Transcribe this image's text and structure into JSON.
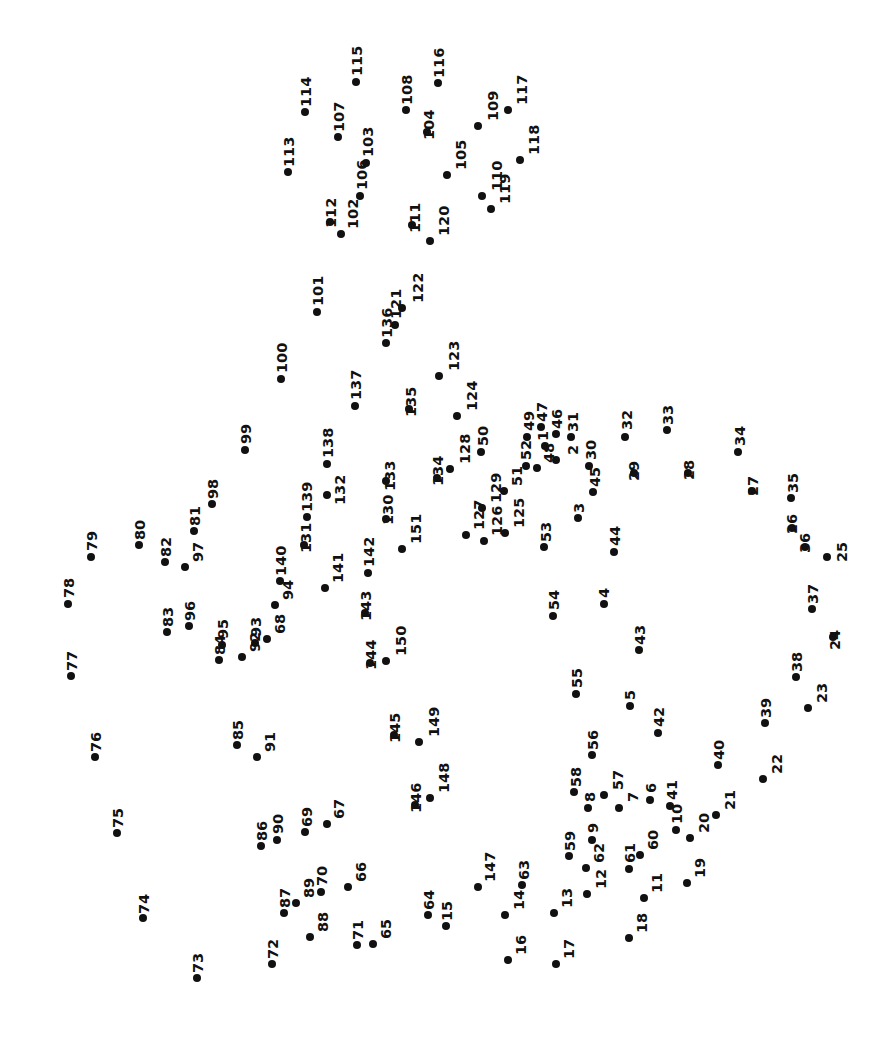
{
  "page": {
    "width": 894,
    "height": 1052,
    "background_color": "#ffffff",
    "dot_color": "#111111",
    "label_color": "#111111",
    "label_rotation_degrees": -90,
    "dot_count": 151
  },
  "dots": [
    {
      "n": "1",
      "x": 545,
      "y": 446,
      "lx": 536,
      "ly": 441
    },
    {
      "n": "2",
      "x": 556,
      "y": 460,
      "lx": 566,
      "ly": 455
    },
    {
      "n": "3",
      "x": 578,
      "y": 518,
      "lx": 572,
      "ly": 513
    },
    {
      "n": "4",
      "x": 604,
      "y": 604,
      "lx": 597,
      "ly": 598
    },
    {
      "n": "5",
      "x": 630,
      "y": 706,
      "lx": 623,
      "ly": 700
    },
    {
      "n": "6",
      "x": 650,
      "y": 800,
      "lx": 644,
      "ly": 793
    },
    {
      "n": "7",
      "x": 619,
      "y": 808,
      "lx": 626,
      "ly": 802
    },
    {
      "n": "8",
      "x": 588,
      "y": 808,
      "lx": 583,
      "ly": 802
    },
    {
      "n": "9",
      "x": 592,
      "y": 840,
      "lx": 586,
      "ly": 833
    },
    {
      "n": "10",
      "x": 676,
      "y": 830,
      "lx": 670,
      "ly": 824
    },
    {
      "n": "11",
      "x": 644,
      "y": 898,
      "lx": 650,
      "ly": 893
    },
    {
      "n": "12",
      "x": 587,
      "y": 894,
      "lx": 594,
      "ly": 889
    },
    {
      "n": "13",
      "x": 554,
      "y": 913,
      "lx": 560,
      "ly": 908
    },
    {
      "n": "14",
      "x": 505,
      "y": 915,
      "lx": 512,
      "ly": 910
    },
    {
      "n": "15",
      "x": 446,
      "y": 926,
      "lx": 440,
      "ly": 921
    },
    {
      "n": "16",
      "x": 508,
      "y": 960,
      "lx": 514,
      "ly": 955
    },
    {
      "n": "17",
      "x": 556,
      "y": 964,
      "lx": 562,
      "ly": 959
    },
    {
      "n": "18",
      "x": 629,
      "y": 938,
      "lx": 635,
      "ly": 933
    },
    {
      "n": "19",
      "x": 687,
      "y": 883,
      "lx": 693,
      "ly": 878
    },
    {
      "n": "20",
      "x": 690,
      "y": 838,
      "lx": 697,
      "ly": 833
    },
    {
      "n": "21",
      "x": 716,
      "y": 815,
      "lx": 723,
      "ly": 810
    },
    {
      "n": "22",
      "x": 763,
      "y": 779,
      "lx": 770,
      "ly": 774
    },
    {
      "n": "23",
      "x": 808,
      "y": 708,
      "lx": 815,
      "ly": 703
    },
    {
      "n": "24",
      "x": 833,
      "y": 637,
      "lx": 828,
      "ly": 650
    },
    {
      "n": "25",
      "x": 827,
      "y": 557,
      "lx": 835,
      "ly": 562
    },
    {
      "n": "26",
      "x": 792,
      "y": 528,
      "lx": 785,
      "ly": 534
    },
    {
      "n": "27",
      "x": 752,
      "y": 491,
      "lx": 746,
      "ly": 496
    },
    {
      "n": "28",
      "x": 688,
      "y": 473,
      "lx": 682,
      "ly": 480
    },
    {
      "n": "29",
      "x": 634,
      "y": 473,
      "lx": 627,
      "ly": 481
    },
    {
      "n": "30",
      "x": 589,
      "y": 466,
      "lx": 584,
      "ly": 460
    },
    {
      "n": "31",
      "x": 571,
      "y": 437,
      "lx": 566,
      "ly": 432
    },
    {
      "n": "32",
      "x": 625,
      "y": 437,
      "lx": 620,
      "ly": 430
    },
    {
      "n": "33",
      "x": 667,
      "y": 430,
      "lx": 661,
      "ly": 425
    },
    {
      "n": "34",
      "x": 738,
      "y": 452,
      "lx": 733,
      "ly": 446
    },
    {
      "n": "35",
      "x": 791,
      "y": 498,
      "lx": 786,
      "ly": 493
    },
    {
      "n": "36",
      "x": 805,
      "y": 547,
      "lx": 798,
      "ly": 553
    },
    {
      "n": "37",
      "x": 812,
      "y": 609,
      "lx": 806,
      "ly": 604
    },
    {
      "n": "38",
      "x": 796,
      "y": 677,
      "lx": 790,
      "ly": 672
    },
    {
      "n": "39",
      "x": 765,
      "y": 723,
      "lx": 759,
      "ly": 718
    },
    {
      "n": "40",
      "x": 718,
      "y": 765,
      "lx": 712,
      "ly": 760
    },
    {
      "n": "41",
      "x": 670,
      "y": 806,
      "lx": 665,
      "ly": 800
    },
    {
      "n": "42",
      "x": 658,
      "y": 733,
      "lx": 652,
      "ly": 727
    },
    {
      "n": "43",
      "x": 639,
      "y": 650,
      "lx": 633,
      "ly": 645
    },
    {
      "n": "44",
      "x": 614,
      "y": 552,
      "lx": 608,
      "ly": 546
    },
    {
      "n": "45",
      "x": 593,
      "y": 492,
      "lx": 588,
      "ly": 487
    },
    {
      "n": "46",
      "x": 556,
      "y": 434,
      "lx": 550,
      "ly": 429
    },
    {
      "n": "47",
      "x": 541,
      "y": 427,
      "lx": 535,
      "ly": 422
    },
    {
      "n": "48",
      "x": 537,
      "y": 468,
      "lx": 542,
      "ly": 463
    },
    {
      "n": "49",
      "x": 527,
      "y": 437,
      "lx": 522,
      "ly": 431
    },
    {
      "n": "50",
      "x": 481,
      "y": 452,
      "lx": 476,
      "ly": 446
    },
    {
      "n": "51",
      "x": 504,
      "y": 491,
      "lx": 510,
      "ly": 486
    },
    {
      "n": "52",
      "x": 526,
      "y": 466,
      "lx": 519,
      "ly": 460
    },
    {
      "n": "53",
      "x": 544,
      "y": 547,
      "lx": 539,
      "ly": 542
    },
    {
      "n": "54",
      "x": 553,
      "y": 616,
      "lx": 547,
      "ly": 610
    },
    {
      "n": "55",
      "x": 576,
      "y": 694,
      "lx": 570,
      "ly": 688
    },
    {
      "n": "56",
      "x": 592,
      "y": 755,
      "lx": 586,
      "ly": 750
    },
    {
      "n": "57",
      "x": 604,
      "y": 795,
      "lx": 611,
      "ly": 790
    },
    {
      "n": "58",
      "x": 574,
      "y": 792,
      "lx": 569,
      "ly": 787
    },
    {
      "n": "59",
      "x": 569,
      "y": 856,
      "lx": 563,
      "ly": 851
    },
    {
      "n": "60",
      "x": 640,
      "y": 855,
      "lx": 646,
      "ly": 850
    },
    {
      "n": "61",
      "x": 629,
      "y": 869,
      "lx": 623,
      "ly": 863
    },
    {
      "n": "62",
      "x": 586,
      "y": 868,
      "lx": 592,
      "ly": 863
    },
    {
      "n": "63",
      "x": 522,
      "y": 885,
      "lx": 517,
      "ly": 880
    },
    {
      "n": "64",
      "x": 428,
      "y": 915,
      "lx": 422,
      "ly": 910
    },
    {
      "n": "65",
      "x": 373,
      "y": 944,
      "lx": 379,
      "ly": 939
    },
    {
      "n": "66",
      "x": 348,
      "y": 887,
      "lx": 354,
      "ly": 882
    },
    {
      "n": "67",
      "x": 327,
      "y": 824,
      "lx": 332,
      "ly": 819
    },
    {
      "n": "68",
      "x": 267,
      "y": 639,
      "lx": 273,
      "ly": 634
    },
    {
      "n": "69",
      "x": 305,
      "y": 832,
      "lx": 300,
      "ly": 827
    },
    {
      "n": "70",
      "x": 321,
      "y": 892,
      "lx": 315,
      "ly": 886
    },
    {
      "n": "71",
      "x": 357,
      "y": 945,
      "lx": 351,
      "ly": 940
    },
    {
      "n": "72",
      "x": 272,
      "y": 964,
      "lx": 266,
      "ly": 959
    },
    {
      "n": "73",
      "x": 197,
      "y": 978,
      "lx": 191,
      "ly": 973
    },
    {
      "n": "74",
      "x": 143,
      "y": 918,
      "lx": 137,
      "ly": 914
    },
    {
      "n": "75",
      "x": 117,
      "y": 833,
      "lx": 111,
      "ly": 828
    },
    {
      "n": "76",
      "x": 95,
      "y": 757,
      "lx": 89,
      "ly": 752
    },
    {
      "n": "77",
      "x": 71,
      "y": 676,
      "lx": 65,
      "ly": 671
    },
    {
      "n": "78",
      "x": 68,
      "y": 604,
      "lx": 62,
      "ly": 598
    },
    {
      "n": "79",
      "x": 91,
      "y": 557,
      "lx": 85,
      "ly": 551
    },
    {
      "n": "80",
      "x": 139,
      "y": 545,
      "lx": 133,
      "ly": 540
    },
    {
      "n": "81",
      "x": 194,
      "y": 531,
      "lx": 188,
      "ly": 526
    },
    {
      "n": "82",
      "x": 165,
      "y": 562,
      "lx": 159,
      "ly": 557
    },
    {
      "n": "83",
      "x": 167,
      "y": 632,
      "lx": 161,
      "ly": 627
    },
    {
      "n": "84",
      "x": 219,
      "y": 660,
      "lx": 213,
      "ly": 655
    },
    {
      "n": "85",
      "x": 237,
      "y": 745,
      "lx": 231,
      "ly": 740
    },
    {
      "n": "86",
      "x": 261,
      "y": 846,
      "lx": 255,
      "ly": 841
    },
    {
      "n": "87",
      "x": 284,
      "y": 913,
      "lx": 278,
      "ly": 908
    },
    {
      "n": "88",
      "x": 310,
      "y": 937,
      "lx": 316,
      "ly": 932
    },
    {
      "n": "89",
      "x": 296,
      "y": 903,
      "lx": 302,
      "ly": 898
    },
    {
      "n": "90",
      "x": 277,
      "y": 840,
      "lx": 271,
      "ly": 834
    },
    {
      "n": "91",
      "x": 257,
      "y": 757,
      "lx": 263,
      "ly": 752
    },
    {
      "n": "92",
      "x": 242,
      "y": 657,
      "lx": 248,
      "ly": 652
    },
    {
      "n": "93",
      "x": 255,
      "y": 643,
      "lx": 249,
      "ly": 637
    },
    {
      "n": "94",
      "x": 275,
      "y": 605,
      "lx": 281,
      "ly": 600
    },
    {
      "n": "95",
      "x": 222,
      "y": 645,
      "lx": 216,
      "ly": 639
    },
    {
      "n": "96",
      "x": 189,
      "y": 626,
      "lx": 183,
      "ly": 621
    },
    {
      "n": "97",
      "x": 185,
      "y": 567,
      "lx": 191,
      "ly": 562
    },
    {
      "n": "98",
      "x": 212,
      "y": 504,
      "lx": 206,
      "ly": 499
    },
    {
      "n": "99",
      "x": 245,
      "y": 450,
      "lx": 239,
      "ly": 444
    },
    {
      "n": "100",
      "x": 281,
      "y": 379,
      "lx": 275,
      "ly": 373
    },
    {
      "n": "101",
      "x": 317,
      "y": 312,
      "lx": 311,
      "ly": 306
    },
    {
      "n": "102",
      "x": 341,
      "y": 234,
      "lx": 346,
      "ly": 229
    },
    {
      "n": "103",
      "x": 366,
      "y": 163,
      "lx": 361,
      "ly": 157
    },
    {
      "n": "104",
      "x": 427,
      "y": 132,
      "lx": 422,
      "ly": 140
    },
    {
      "n": "105",
      "x": 447,
      "y": 175,
      "lx": 454,
      "ly": 170
    },
    {
      "n": "106",
      "x": 360,
      "y": 196,
      "lx": 355,
      "ly": 190
    },
    {
      "n": "107",
      "x": 338,
      "y": 137,
      "lx": 332,
      "ly": 132
    },
    {
      "n": "108",
      "x": 406,
      "y": 110,
      "lx": 400,
      "ly": 105
    },
    {
      "n": "109",
      "x": 478,
      "y": 126,
      "lx": 486,
      "ly": 121
    },
    {
      "n": "110",
      "x": 482,
      "y": 196,
      "lx": 490,
      "ly": 191
    },
    {
      "n": "111",
      "x": 412,
      "y": 225,
      "lx": 408,
      "ly": 233
    },
    {
      "n": "112",
      "x": 330,
      "y": 222,
      "lx": 324,
      "ly": 228
    },
    {
      "n": "113",
      "x": 288,
      "y": 172,
      "lx": 282,
      "ly": 167
    },
    {
      "n": "114",
      "x": 305,
      "y": 112,
      "lx": 299,
      "ly": 107
    },
    {
      "n": "115",
      "x": 356,
      "y": 82,
      "lx": 350,
      "ly": 76
    },
    {
      "n": "116",
      "x": 438,
      "y": 83,
      "lx": 432,
      "ly": 78
    },
    {
      "n": "117",
      "x": 508,
      "y": 110,
      "lx": 515,
      "ly": 105
    },
    {
      "n": "118",
      "x": 520,
      "y": 160,
      "lx": 527,
      "ly": 155
    },
    {
      "n": "119",
      "x": 491,
      "y": 209,
      "lx": 498,
      "ly": 204
    },
    {
      "n": "120",
      "x": 430,
      "y": 241,
      "lx": 437,
      "ly": 236
    },
    {
      "n": "121",
      "x": 395,
      "y": 325,
      "lx": 389,
      "ly": 319
    },
    {
      "n": "122",
      "x": 402,
      "y": 308,
      "lx": 411,
      "ly": 303
    },
    {
      "n": "123",
      "x": 439,
      "y": 376,
      "lx": 447,
      "ly": 371
    },
    {
      "n": "124",
      "x": 457,
      "y": 416,
      "lx": 465,
      "ly": 411
    },
    {
      "n": "125",
      "x": 505,
      "y": 533,
      "lx": 512,
      "ly": 528
    },
    {
      "n": "126",
      "x": 484,
      "y": 541,
      "lx": 490,
      "ly": 536
    },
    {
      "n": "127",
      "x": 466,
      "y": 535,
      "lx": 472,
      "ly": 530
    },
    {
      "n": "128",
      "x": 450,
      "y": 469,
      "lx": 458,
      "ly": 464
    },
    {
      "n": "129",
      "x": 482,
      "y": 508,
      "lx": 489,
      "ly": 503
    },
    {
      "n": "130",
      "x": 386,
      "y": 519,
      "lx": 381,
      "ly": 525
    },
    {
      "n": "131",
      "x": 304,
      "y": 545,
      "lx": 299,
      "ly": 553
    },
    {
      "n": "132",
      "x": 327,
      "y": 495,
      "lx": 333,
      "ly": 505
    },
    {
      "n": "133",
      "x": 386,
      "y": 481,
      "lx": 383,
      "ly": 491
    },
    {
      "n": "134",
      "x": 437,
      "y": 478,
      "lx": 431,
      "ly": 486
    },
    {
      "n": "135",
      "x": 409,
      "y": 409,
      "lx": 404,
      "ly": 417
    },
    {
      "n": "136",
      "x": 386,
      "y": 343,
      "lx": 380,
      "ly": 338
    },
    {
      "n": "137",
      "x": 355,
      "y": 406,
      "lx": 349,
      "ly": 400
    },
    {
      "n": "138",
      "x": 327,
      "y": 464,
      "lx": 321,
      "ly": 458
    },
    {
      "n": "139",
      "x": 307,
      "y": 517,
      "lx": 300,
      "ly": 512
    },
    {
      "n": "140",
      "x": 280,
      "y": 581,
      "lx": 274,
      "ly": 576
    },
    {
      "n": "141",
      "x": 325,
      "y": 588,
      "lx": 331,
      "ly": 583
    },
    {
      "n": "142",
      "x": 368,
      "y": 573,
      "lx": 362,
      "ly": 567
    },
    {
      "n": "143",
      "x": 365,
      "y": 613,
      "lx": 359,
      "ly": 621
    },
    {
      "n": "144",
      "x": 370,
      "y": 663,
      "lx": 364,
      "ly": 670
    },
    {
      "n": "145",
      "x": 394,
      "y": 735,
      "lx": 388,
      "ly": 743
    },
    {
      "n": "146",
      "x": 415,
      "y": 805,
      "lx": 409,
      "ly": 813
    },
    {
      "n": "147",
      "x": 478,
      "y": 887,
      "lx": 483,
      "ly": 882
    },
    {
      "n": "148",
      "x": 430,
      "y": 798,
      "lx": 437,
      "ly": 793
    },
    {
      "n": "149",
      "x": 419,
      "y": 742,
      "lx": 427,
      "ly": 737
    },
    {
      "n": "150",
      "x": 386,
      "y": 661,
      "lx": 394,
      "ly": 656
    },
    {
      "n": "151",
      "x": 402,
      "y": 549,
      "lx": 409,
      "ly": 544
    }
  ]
}
